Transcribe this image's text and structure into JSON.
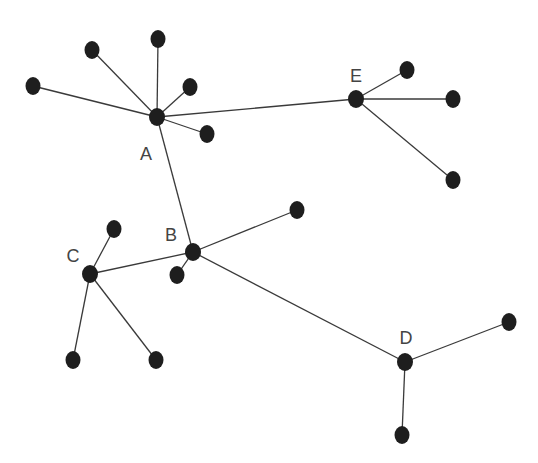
{
  "diagram": {
    "type": "network-graph",
    "hubs": [
      {
        "id": "A",
        "label": "A",
        "x": 157,
        "y": 117,
        "lx": 146,
        "ly": 160
      },
      {
        "id": "B",
        "label": "B",
        "x": 193,
        "y": 252,
        "lx": 171,
        "ly": 241
      },
      {
        "id": "C",
        "label": "C",
        "x": 90,
        "y": 274,
        "lx": 73,
        "ly": 262
      },
      {
        "id": "D",
        "label": "D",
        "x": 405,
        "y": 362,
        "lx": 406,
        "ly": 344
      },
      {
        "id": "E",
        "label": "E",
        "x": 356,
        "y": 99,
        "lx": 356,
        "ly": 82
      }
    ],
    "leaves": [
      {
        "id": "a1",
        "x": 33,
        "y": 86
      },
      {
        "id": "a2",
        "x": 92,
        "y": 50
      },
      {
        "id": "a3",
        "x": 158,
        "y": 39
      },
      {
        "id": "a4",
        "x": 190,
        "y": 87
      },
      {
        "id": "a5",
        "x": 207,
        "y": 134
      },
      {
        "id": "e1",
        "x": 407,
        "y": 70
      },
      {
        "id": "e2",
        "x": 453,
        "y": 99
      },
      {
        "id": "e3",
        "x": 453,
        "y": 180
      },
      {
        "id": "b1",
        "x": 297,
        "y": 210
      },
      {
        "id": "b2",
        "x": 177,
        "y": 275
      },
      {
        "id": "c1",
        "x": 114,
        "y": 229
      },
      {
        "id": "c2",
        "x": 73,
        "y": 360
      },
      {
        "id": "c3",
        "x": 156,
        "y": 360
      },
      {
        "id": "d1",
        "x": 509,
        "y": 322
      },
      {
        "id": "d2",
        "x": 402,
        "y": 435
      }
    ],
    "edges": [
      [
        "A",
        "a1"
      ],
      [
        "A",
        "a2"
      ],
      [
        "A",
        "a3"
      ],
      [
        "A",
        "a4"
      ],
      [
        "A",
        "a5"
      ],
      [
        "A",
        "E"
      ],
      [
        "A",
        "B"
      ],
      [
        "E",
        "e1"
      ],
      [
        "E",
        "e2"
      ],
      [
        "E",
        "e3"
      ],
      [
        "B",
        "b1"
      ],
      [
        "B",
        "b2"
      ],
      [
        "B",
        "C"
      ],
      [
        "B",
        "D"
      ],
      [
        "C",
        "c1"
      ],
      [
        "C",
        "c2"
      ],
      [
        "C",
        "c3"
      ],
      [
        "D",
        "d1"
      ],
      [
        "D",
        "d2"
      ]
    ],
    "colors": {
      "node": "#1e1e1e",
      "edge": "#3a3a3a",
      "label": "#444444",
      "background": "#ffffff"
    }
  }
}
